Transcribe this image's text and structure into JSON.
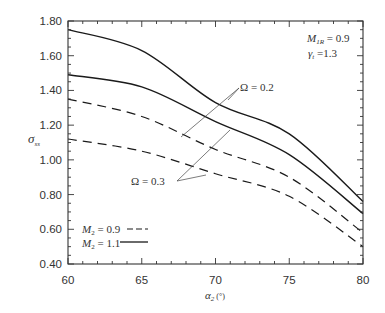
{
  "chart_data": {
    "type": "line",
    "title": "",
    "xlabel": "α₂ (°)",
    "ylabel": "σ_ss",
    "xlim": [
      60,
      80
    ],
    "ylim": [
      0.4,
      1.8
    ],
    "xticks": [
      60,
      65,
      70,
      75,
      80
    ],
    "xtick_labels": [
      "60",
      "65",
      "70",
      "75",
      "80"
    ],
    "yticks": [
      0.4,
      0.6,
      0.8,
      1.0,
      1.2,
      1.4,
      1.6,
      1.8
    ],
    "ytick_labels": [
      "0.40",
      "0.60",
      "0.80",
      "1.00",
      "1.20",
      "1.40",
      "1.60",
      "1.80"
    ],
    "x_minor_step": 1,
    "y_minor_step": 0.05,
    "grid": false,
    "x": [
      60,
      65,
      70,
      75,
      80
    ],
    "series": [
      {
        "name": "M2 = 1.1, Ω = 0.2",
        "style": "solid",
        "values": [
          1.75,
          1.63,
          1.33,
          1.15,
          0.76
        ]
      },
      {
        "name": "M2 = 1.1, Ω = 0.3",
        "style": "solid",
        "values": [
          1.49,
          1.42,
          1.22,
          1.03,
          0.69
        ]
      },
      {
        "name": "M2 = 0.9, Ω = 0.2",
        "style": "dashed",
        "values": [
          1.35,
          1.25,
          1.06,
          0.9,
          0.58
        ]
      },
      {
        "name": "M2 = 0.9, Ω = 0.3",
        "style": "dashed",
        "values": [
          1.12,
          1.05,
          0.92,
          0.79,
          0.5
        ]
      }
    ],
    "legend": {
      "position": "lower left",
      "entries": [
        {
          "label": "M₂ = 0.9",
          "style": "dashed"
        },
        {
          "label": "M₂ = 1.1",
          "style": "solid"
        }
      ]
    },
    "annotations": [
      {
        "text": "M_1R = 0.9",
        "position": "top right"
      },
      {
        "text": "γ_t = 1.3",
        "position": "top right"
      },
      {
        "text": "Ω = 0.2",
        "points_to": [
          "M2 = 1.1, Ω = 0.2",
          "M2 = 0.9, Ω = 0.2"
        ]
      },
      {
        "text": "Ω = 0.3",
        "points_to": [
          "M2 = 1.1, Ω = 0.3",
          "M2 = 0.9, Ω = 0.3"
        ]
      }
    ]
  },
  "labels": {
    "ylabel_main": "σ",
    "ylabel_sub": "ss",
    "xlabel_main": "α",
    "xlabel_sub": "2",
    "xlabel_unit": " (°)",
    "param1_main": "M",
    "param1_sub": "1R",
    "param1_value": " = 0.9",
    "param2_main": "γ",
    "param2_sub": "t",
    "param2_value": " =1.3",
    "omega02": "Ω = 0.2",
    "omega03": "Ω = 0.3",
    "legend1_main": "M",
    "legend1_sub": "2",
    "legend1_value": " = 0.9",
    "legend2_main": "M",
    "legend2_sub": "2",
    "legend2_value": " = 1.1"
  },
  "colors": {
    "line": "#1a1a1a",
    "axis": "#333333",
    "leader": "#444444"
  }
}
